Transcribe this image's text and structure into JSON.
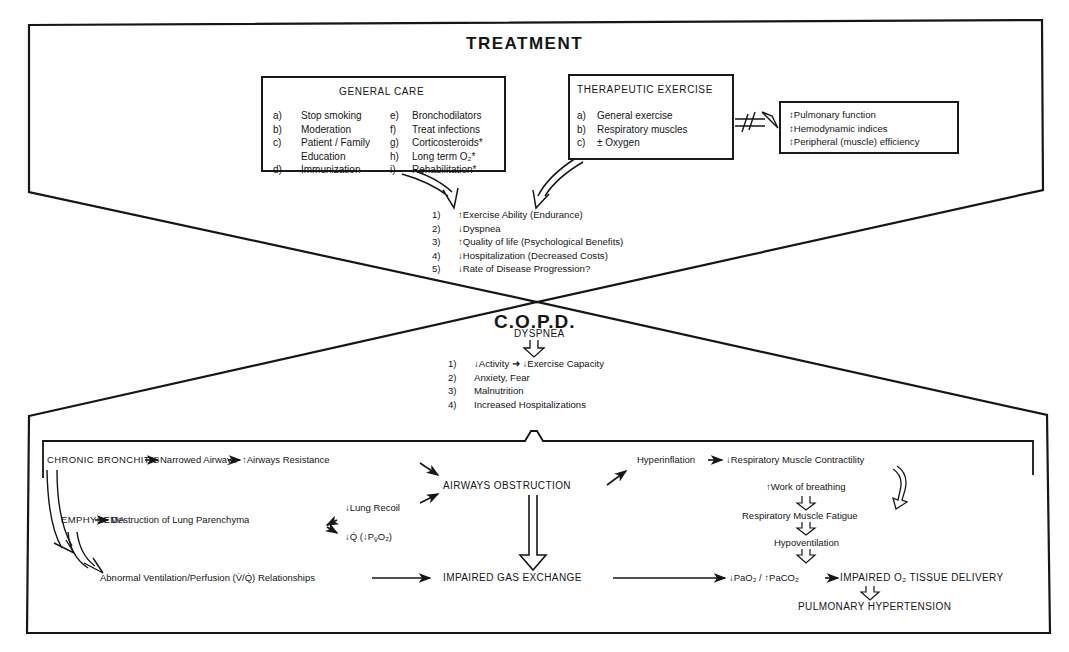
{
  "treatment": {
    "title": "TREATMENT",
    "general_care": {
      "heading": "GENERAL CARE",
      "left_items": [
        {
          "label": "a)",
          "text": "Stop smoking"
        },
        {
          "label": "b)",
          "text": "Moderation"
        },
        {
          "label": "c)",
          "text": "Patient / Family"
        },
        {
          "label": "",
          "text": "Education"
        },
        {
          "label": "d)",
          "text": "Immunization"
        }
      ],
      "right_items": [
        {
          "label": "e)",
          "text": "Bronchodilators"
        },
        {
          "label": "f)",
          "text": "Treat infections"
        },
        {
          "label": "g)",
          "text": "Corticosteroids*"
        },
        {
          "label": "h)",
          "text": "Long term O₂*"
        },
        {
          "label": "i)",
          "text": "Rehabilitation*"
        }
      ]
    },
    "therapeutic_exercise": {
      "heading": "THERAPEUTIC EXERCISE",
      "items": [
        {
          "label": "a)",
          "text": "General exercise"
        },
        {
          "label": "b)",
          "text": "Respiratory muscles"
        },
        {
          "label": "c)",
          "text": "± Oxygen"
        }
      ]
    },
    "no_effect_box": {
      "items": [
        "↕Pulmonary function",
        "↕Hemodynamic indices",
        "↕Peripheral (muscle) efficiency"
      ]
    },
    "outcomes": [
      {
        "num": "1)",
        "text": "↑Exercise Ability (Endurance)"
      },
      {
        "num": "2)",
        "text": "↓Dyspnea"
      },
      {
        "num": "3)",
        "text": "↑Quality of life (Psychological Benefits)"
      },
      {
        "num": "4)",
        "text": "↓Hospitalization (Decreased Costs)"
      },
      {
        "num": "5)",
        "text": "↓Rate of Disease Progression?"
      }
    ]
  },
  "copd": {
    "title": "C.O.P.D.",
    "dyspnea": "DYSPNEA",
    "consequences": [
      {
        "num": "1)",
        "text": "↓Activity ➜ ↓Exercise Capacity"
      },
      {
        "num": "2)",
        "text": "Anxiety, Fear"
      },
      {
        "num": "3)",
        "text": "Malnutrition"
      },
      {
        "num": "4)",
        "text": "Increased Hospitalizations"
      }
    ]
  },
  "pathophysiology": {
    "chronic_bronchitis": "CHRONIC BRONCHITIS",
    "narrowed_airways": "Narrowed Airways",
    "airways_resistance": "↑Airways Resistance",
    "emphysema": "EMPHYSEMA",
    "destruction": "Destruction of Lung Parenchyma",
    "lung_recoil": "↓Lung Recoil",
    "q_dot": "↓Q̇ (↓P",
    "q_dot_sub": "v̄",
    "q_dot_end": "O₂)",
    "airways_obstruction": "AIRWAYS OBSTRUCTION",
    "abnormal_vq": "Abnormal Ventilation/Perfusion (V̇/Q̇) Relationships",
    "impaired_gas_exchange": "IMPAIRED GAS EXCHANGE",
    "hyperinflation": "Hyperinflation",
    "resp_muscle_contractility": "↓Respiratory Muscle Contractility",
    "work_of_breathing": "↑Work of breathing",
    "resp_muscle_fatigue": "Respiratory Muscle Fatigue",
    "hypoventilation": "Hypoventilation",
    "pao2": "↓PaO₂ / ↑PaCO₂",
    "impaired_o2_delivery": "IMPAIRED O₂ TISSUE DELIVERY",
    "pulmonary_hypertension": "PULMONARY HYPERTENSION"
  },
  "colors": {
    "ink": "#161616",
    "background": "#ffffff"
  }
}
